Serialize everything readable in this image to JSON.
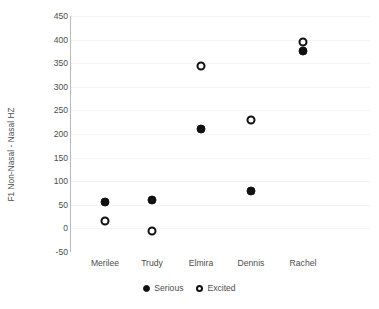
{
  "chart_data": {
    "type": "scatter",
    "title": "",
    "xlabel": "",
    "ylabel": "F1 Non-Nasal - Nasal HZ",
    "categories": [
      "Merilee",
      "Trudy",
      "Elmira",
      "Dennis",
      "Rachel"
    ],
    "series": [
      {
        "name": "Serious",
        "marker": "filled-circle",
        "color": "#111111",
        "values": [
          55,
          60,
          210,
          80,
          375
        ]
      },
      {
        "name": "Excited",
        "marker": "open-circle",
        "color": "#111111",
        "values": [
          15,
          -5,
          345,
          230,
          395
        ]
      }
    ],
    "ylim": [
      -50,
      450
    ],
    "yticks": [
      450,
      400,
      350,
      300,
      250,
      200,
      150,
      100,
      50,
      0,
      -50
    ],
    "ytick_labels": [
      "450",
      "400",
      "350",
      "300",
      "250",
      "200",
      "150",
      "100",
      "50",
      "0",
      "-50"
    ],
    "grid": true,
    "legend_position": "bottom"
  },
  "legend": {
    "entries": [
      {
        "label": "Serious",
        "marker": "filled-circle"
      },
      {
        "label": "Excited",
        "marker": "open-circle"
      }
    ]
  },
  "axes": {
    "y_label": "F1 Non-Nasal - Nasal HZ"
  }
}
